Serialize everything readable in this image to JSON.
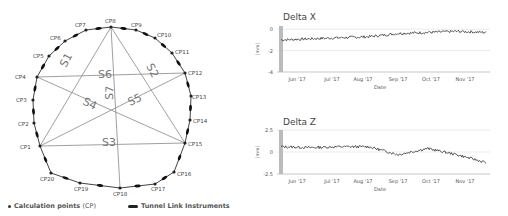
{
  "diagram": {
    "points": [
      {
        "id": "CP1",
        "x": 40,
        "y": 146,
        "lx": 20,
        "ly": 149
      },
      {
        "id": "CP2",
        "x": 34,
        "y": 123,
        "lx": 18,
        "ly": 126
      },
      {
        "id": "CP3",
        "x": 33,
        "y": 100,
        "lx": 16,
        "ly": 102
      },
      {
        "id": "CP4",
        "x": 37,
        "y": 77,
        "lx": 15,
        "ly": 79
      },
      {
        "id": "CP5",
        "x": 49,
        "y": 56,
        "lx": 33,
        "ly": 58
      },
      {
        "id": "CP6",
        "x": 65,
        "y": 41,
        "lx": 50,
        "ly": 40
      },
      {
        "id": "CP7",
        "x": 86,
        "y": 30,
        "lx": 75,
        "ly": 27
      },
      {
        "id": "CP8",
        "x": 111,
        "y": 27,
        "lx": 105,
        "ly": 23
      },
      {
        "id": "CP9",
        "x": 136,
        "y": 30,
        "lx": 131,
        "ly": 27
      },
      {
        "id": "CP10",
        "x": 155,
        "y": 38,
        "lx": 157,
        "ly": 37
      },
      {
        "id": "CP11",
        "x": 172,
        "y": 53,
        "lx": 175,
        "ly": 54
      },
      {
        "id": "CP12",
        "x": 185,
        "y": 73,
        "lx": 188,
        "ly": 75
      },
      {
        "id": "CP13",
        "x": 191,
        "y": 96,
        "lx": 192,
        "ly": 99
      },
      {
        "id": "CP14",
        "x": 190,
        "y": 120,
        "lx": 193,
        "ly": 123
      },
      {
        "id": "CP15",
        "x": 185,
        "y": 143,
        "lx": 188,
        "ly": 146
      },
      {
        "id": "CP16",
        "x": 174,
        "y": 172,
        "lx": 177,
        "ly": 176
      },
      {
        "id": "CP17",
        "x": 155,
        "y": 184,
        "lx": 151,
        "ly": 191
      },
      {
        "id": "CP18",
        "x": 120,
        "y": 188,
        "lx": 113,
        "ly": 196
      },
      {
        "id": "CP19",
        "x": 80,
        "y": 183,
        "lx": 74,
        "ly": 191
      },
      {
        "id": "CP20",
        "x": 51,
        "y": 173,
        "lx": 40,
        "ly": 181
      }
    ],
    "segments": [
      {
        "label": "S1",
        "lx": 66,
        "ly": 68,
        "rot": -62
      },
      {
        "label": "S2",
        "lx": 146,
        "ly": 66,
        "rot": 62
      },
      {
        "label": "S3",
        "lx": 102,
        "ly": 146,
        "rot": 0
      },
      {
        "label": "S4",
        "lx": 82,
        "ly": 104,
        "rot": 25
      },
      {
        "label": "S5",
        "lx": 130,
        "ly": 106,
        "rot": -25
      },
      {
        "label": "S6",
        "lx": 98,
        "ly": 78,
        "rot": 0
      },
      {
        "label": "S7",
        "lx": 113,
        "ly": 100,
        "rot": -88
      }
    ],
    "legend": {
      "calc_points": "Calculation points",
      "calc_points_abbr": "(CP)",
      "instruments": "Tunnel Link Instruments"
    }
  },
  "charts": {
    "delta_x": {
      "title": "Delta X",
      "ylabel": "[mm]",
      "xlabel": "Date",
      "yticks": [
        "0",
        "-2",
        "-4"
      ]
    },
    "delta_z": {
      "title": "Delta Z",
      "ylabel": "[mm]",
      "xlabel": "Date",
      "yticks": [
        "2.5",
        "0",
        "-2.5"
      ]
    },
    "xticks": [
      "Jun '17",
      "Jul '17",
      "Aug '17",
      "Sep '17",
      "Oct '17",
      "Nov '17"
    ]
  },
  "chart_data": [
    {
      "type": "line",
      "title": "Delta X",
      "xlabel": "Date",
      "ylabel": "[mm]",
      "ylim": [
        -4,
        0.3
      ],
      "x": [
        "May '17",
        "Jun '17",
        "Jul '17",
        "Aug '17",
        "Sep '17",
        "Oct '17",
        "Nov '17",
        "Dec '17"
      ],
      "series": [
        {
          "name": "Delta X",
          "values": [
            -1.0,
            -0.9,
            -0.8,
            -0.7,
            -0.4,
            -0.3,
            -0.2,
            -0.3
          ]
        }
      ],
      "grid": true
    },
    {
      "type": "line",
      "title": "Delta Z",
      "xlabel": "Date",
      "ylabel": "[mm]",
      "ylim": [
        -2.5,
        2.5
      ],
      "x": [
        "May '17",
        "Jun '17",
        "Jul '17",
        "Aug '17",
        "Sep '17",
        "Oct '17",
        "Nov '17",
        "Dec '17"
      ],
      "series": [
        {
          "name": "Delta Z",
          "values": [
            0.6,
            0.5,
            0.6,
            0.6,
            -0.3,
            0.4,
            -0.3,
            -1.2
          ]
        }
      ],
      "grid": true
    }
  ]
}
